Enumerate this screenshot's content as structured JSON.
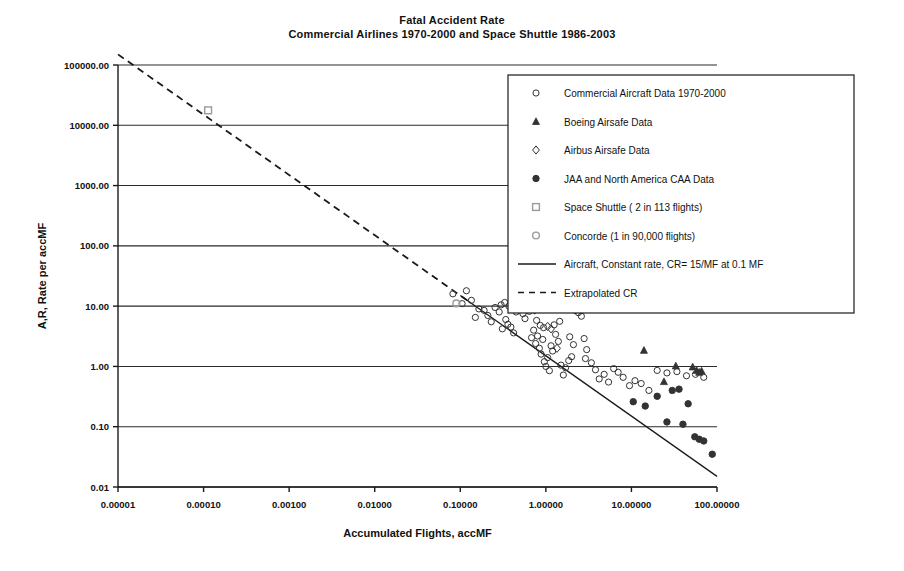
{
  "title": {
    "line1": "Fatal Accident Rate",
    "line2": "Commercial Airlines 1970-2000 and Space Shuttle 1986-2003"
  },
  "chart_data": {
    "type": "scatter",
    "xlabel": "Accumulated Flights, accMF",
    "ylabel": "A,R, Rate per accMF",
    "xscale": "log",
    "yscale": "log",
    "xlim": [
      1e-05,
      100
    ],
    "ylim": [
      0.01,
      100000
    ],
    "grid": "horizontal-only",
    "legend_position": "upper-right-inside",
    "xticks": [
      "0.00001",
      "0.00010",
      "0.00100",
      "0.01000",
      "0.10000",
      "1.00000",
      "10.00000",
      "100.00000"
    ],
    "xtick_values": [
      1e-05,
      0.0001,
      0.001,
      0.01,
      0.1,
      1,
      10,
      100
    ],
    "yticks": [
      "100000.00",
      "10000.00",
      "1000.00",
      "100.00",
      "10.00",
      "1.00",
      "0.10",
      "0.01"
    ],
    "ytick_values": [
      100000,
      10000,
      1000,
      100,
      10,
      1,
      0.1,
      0.01
    ],
    "series": [
      {
        "name": "Commercial Aircraft Data 1970-2000",
        "marker": "open-circle",
        "points": [
          [
            0.082,
            16.0
          ],
          [
            0.105,
            11.0
          ],
          [
            0.118,
            18.0
          ],
          [
            0.135,
            12.5
          ],
          [
            0.15,
            6.5
          ],
          [
            0.165,
            9.0
          ],
          [
            0.19,
            8.5
          ],
          [
            0.21,
            7.0
          ],
          [
            0.23,
            5.5
          ],
          [
            0.255,
            9.5
          ],
          [
            0.285,
            8.0
          ],
          [
            0.31,
            4.2
          ],
          [
            0.34,
            6.0
          ],
          [
            0.36,
            5.0
          ],
          [
            0.39,
            4.5
          ],
          [
            0.42,
            3.6
          ],
          [
            0.45,
            8.0
          ],
          [
            0.48,
            9.5
          ],
          [
            0.51,
            8.8
          ],
          [
            0.54,
            7.5
          ],
          [
            0.57,
            6.2
          ],
          [
            0.6,
            9.0
          ],
          [
            0.64,
            8.2
          ],
          [
            0.68,
            3.0
          ],
          [
            0.72,
            4.0
          ],
          [
            0.76,
            2.4
          ],
          [
            0.8,
            3.2
          ],
          [
            0.84,
            2.0
          ],
          [
            0.88,
            1.6
          ],
          [
            0.92,
            2.8
          ],
          [
            0.96,
            1.2
          ],
          [
            1.0,
            1.0
          ],
          [
            1.05,
            1.4
          ],
          [
            1.1,
            0.85
          ],
          [
            1.15,
            2.2
          ],
          [
            1.2,
            1.8
          ],
          [
            1.3,
            3.4
          ],
          [
            1.4,
            2.6
          ],
          [
            1.5,
            1.05
          ],
          [
            1.6,
            0.72
          ],
          [
            1.7,
            0.95
          ],
          [
            1.85,
            1.25
          ],
          [
            2.0,
            1.45
          ],
          [
            2.2,
            8.5
          ],
          [
            2.4,
            7.8
          ],
          [
            2.6,
            6.8
          ],
          [
            2.8,
            2.9
          ],
          [
            3.0,
            1.9
          ],
          [
            3.4,
            1.15
          ],
          [
            3.8,
            0.88
          ],
          [
            4.2,
            0.62
          ],
          [
            4.8,
            0.74
          ],
          [
            5.4,
            0.55
          ],
          [
            6.2,
            0.92
          ],
          [
            7.0,
            0.8
          ],
          [
            8.0,
            0.66
          ],
          [
            9.5,
            0.48
          ],
          [
            11.0,
            0.58
          ],
          [
            13.0,
            0.52
          ],
          [
            16.0,
            0.4
          ],
          [
            20.0,
            0.86
          ],
          [
            26.0,
            0.78
          ],
          [
            34.0,
            0.82
          ],
          [
            44.0,
            0.7
          ],
          [
            56.0,
            0.74
          ],
          [
            70.0,
            0.66
          ],
          [
            0.3,
            10.5
          ],
          [
            0.33,
            11.5
          ],
          [
            0.37,
            10.0
          ],
          [
            0.41,
            9.2
          ],
          [
            0.62,
            10.5
          ],
          [
            0.7,
            9.8
          ],
          [
            0.78,
            5.8
          ],
          [
            0.86,
            4.8
          ],
          [
            0.94,
            4.4
          ],
          [
            1.25,
            4.9
          ],
          [
            1.45,
            5.6
          ],
          [
            1.9,
            3.1
          ],
          [
            2.1,
            2.3
          ],
          [
            2.9,
            1.35
          ]
        ]
      },
      {
        "name": "Boeing Airsafe Data",
        "marker": "filled-triangle",
        "points": [
          [
            14.0,
            1.85
          ],
          [
            33.0,
            1.02
          ],
          [
            52.0,
            0.98
          ],
          [
            58.0,
            0.86
          ],
          [
            62.0,
            0.8
          ],
          [
            24.0,
            0.56
          ],
          [
            66.0,
            0.84
          ]
        ]
      },
      {
        "name": "Airbus Airsafe Data",
        "marker": "open-diamond",
        "points": [
          [
            0.52,
            9.2
          ],
          [
            0.6,
            8.8
          ],
          [
            0.66,
            9.4
          ],
          [
            0.74,
            8.6
          ],
          [
            1.05,
            4.6
          ],
          [
            1.15,
            4.2
          ],
          [
            0.46,
            9.8
          ],
          [
            1.35,
            2.0
          ]
        ]
      },
      {
        "name": "JAA and North America CAA Data",
        "marker": "filled-circle",
        "points": [
          [
            10.5,
            0.26
          ],
          [
            14.5,
            0.22
          ],
          [
            20.0,
            0.32
          ],
          [
            26.0,
            0.12
          ],
          [
            40.0,
            0.11
          ],
          [
            55.0,
            0.068
          ],
          [
            62.0,
            0.062
          ],
          [
            70.0,
            0.058
          ],
          [
            88.0,
            0.035
          ],
          [
            30.0,
            0.4
          ],
          [
            36.0,
            0.42
          ],
          [
            46.0,
            0.24
          ]
        ]
      },
      {
        "name": "Space Shuttle ( 2 in 113 flights)",
        "marker": "open-square-gray",
        "points": [
          [
            0.000113,
            17700
          ]
        ]
      },
      {
        "name": "Concorde (1 in 90,000 flights)",
        "marker": "open-circle-gray",
        "points": [
          [
            0.09,
            11.1
          ]
        ]
      }
    ],
    "lines": [
      {
        "name": "Aircraft, Constant rate, CR= 15/MF at 0.1 MF",
        "style": "solid",
        "from": [
          0.1,
          15
        ],
        "to": [
          100,
          0.015
        ]
      },
      {
        "name": "Extrapolated CR",
        "style": "dashed",
        "from": [
          1e-05,
          150000
        ],
        "to": [
          0.12,
          12.5
        ]
      }
    ]
  },
  "legend": {
    "items": [
      {
        "marker": "open-circle",
        "label": "Commercial Aircraft Data 1970-2000"
      },
      {
        "marker": "filled-triangle",
        "label": "Boeing Airsafe Data"
      },
      {
        "marker": "open-diamond",
        "label": "Airbus Airsafe Data"
      },
      {
        "marker": "filled-circle",
        "label": "JAA and North America CAA Data"
      },
      {
        "marker": "open-square-gray",
        "label": "Space Shuttle ( 2 in 113 flights)"
      },
      {
        "marker": "open-circle-gray",
        "label": "Concorde (1 in 90,000 flights)"
      },
      {
        "marker": "solid-line",
        "label": "Aircraft, Constant rate, CR= 15/MF at 0.1 MF"
      },
      {
        "marker": "dashed-line",
        "label": "Extrapolated CR"
      }
    ]
  },
  "colors": {
    "axis": "#1a1a1a",
    "grid": "#2b2b2b",
    "marker": "#333333",
    "gray_marker": "#9a9a9a",
    "background": "#ffffff"
  }
}
